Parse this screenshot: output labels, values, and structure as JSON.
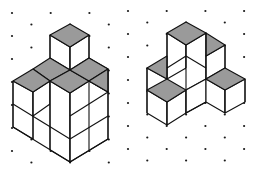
{
  "figure": {
    "colors": {
      "background": "#ffffff",
      "top_face": "#9a9a9a",
      "side_face": "#ffffff",
      "edge": "#111111",
      "dot": "#1a1a1a"
    },
    "grid": {
      "col_spacing": 19.35,
      "row_spacing": 23,
      "left_origin": [
        12,
        13
      ],
      "right_origin": [
        128,
        11
      ]
    },
    "left_solid": {
      "label": "left-cube-structure",
      "top_faces": [
        [
          [
            70,
            24
          ],
          [
            89,
            35
          ],
          [
            70,
            47
          ],
          [
            50,
            35
          ]
        ],
        [
          [
            33,
            69
          ],
          [
            50,
            58
          ],
          [
            70,
            70
          ],
          [
            50,
            81
          ]
        ],
        [
          [
            13,
            81
          ],
          [
            33,
            69
          ],
          [
            50,
            81
          ],
          [
            33,
            92
          ]
        ],
        [
          [
            50,
            81
          ],
          [
            70,
            70
          ],
          [
            89,
            81
          ],
          [
            70,
            93
          ]
        ],
        [
          [
            70,
            70
          ],
          [
            89,
            58
          ],
          [
            108,
            69
          ],
          [
            89,
            81
          ]
        ],
        [
          [
            89,
            81
          ],
          [
            108,
            69
          ],
          [
            108,
            92
          ],
          [
            89,
            81
          ]
        ]
      ],
      "lines": [
        [
          [
            50,
            35
          ],
          [
            50,
            58
          ]
        ],
        [
          [
            70,
            47
          ],
          [
            70,
            70
          ]
        ],
        [
          [
            89,
            35
          ],
          [
            89,
            58
          ]
        ],
        [
          [
            89,
            58
          ],
          [
            108,
            69
          ]
        ],
        [
          [
            108,
            69
          ],
          [
            108,
            116
          ]
        ],
        [
          [
            13,
            81
          ],
          [
            13,
            127
          ]
        ],
        [
          [
            33,
            92
          ],
          [
            33,
            139
          ]
        ],
        [
          [
            50,
            81
          ],
          [
            50,
            104
          ]
        ],
        [
          [
            70,
            93
          ],
          [
            70,
            162
          ]
        ],
        [
          [
            89,
            81
          ],
          [
            89,
            104
          ]
        ],
        [
          [
            108,
            92
          ],
          [
            108,
            139
          ]
        ],
        [
          [
            13,
            104
          ],
          [
            70,
            139
          ]
        ],
        [
          [
            13,
            127
          ],
          [
            70,
            162
          ]
        ],
        [
          [
            70,
            162
          ],
          [
            108,
            139
          ]
        ],
        [
          [
            70,
            139
          ],
          [
            108,
            116
          ]
        ],
        [
          [
            33,
            92
          ],
          [
            50,
            81
          ]
        ],
        [
          [
            70,
            93
          ],
          [
            89,
            81
          ]
        ],
        [
          [
            89,
            81
          ],
          [
            108,
            92
          ]
        ]
      ]
    },
    "right_solid": {
      "label": "right-cube-structure",
      "top_faces": [
        [
          [
            186,
            22
          ],
          [
            206,
            33
          ],
          [
            186,
            45
          ],
          [
            167,
            33
          ]
        ],
        [
          [
            206,
            33
          ],
          [
            225,
            45
          ],
          [
            206,
            56
          ],
          [
            206,
            33
          ]
        ],
        [
          [
            147,
            56
          ],
          [
            167,
            45
          ],
          [
            167,
            79
          ],
          [
            147,
            68
          ]
        ],
        [
          [
            147,
            90
          ],
          [
            167,
            79
          ],
          [
            186,
            90
          ],
          [
            167,
            102
          ]
        ],
        [
          [
            206,
            79
          ],
          [
            225,
            68
          ],
          [
            245,
            79
          ],
          [
            225,
            90
          ]
        ]
      ],
      "lines": [
        [
          [
            167,
            33
          ],
          [
            167,
            79
          ]
        ],
        [
          [
            186,
            45
          ],
          [
            186,
            68
          ]
        ],
        [
          [
            206,
            33
          ],
          [
            206,
            79
          ]
        ],
        [
          [
            225,
            45
          ],
          [
            225,
            68
          ]
        ],
        [
          [
            147,
            68
          ],
          [
            147,
            113
          ]
        ],
        [
          [
            167,
            102
          ],
          [
            167,
            125
          ]
        ],
        [
          [
            186,
            90
          ],
          [
            186,
            113
          ]
        ],
        [
          [
            225,
            90
          ],
          [
            225,
            113
          ]
        ],
        [
          [
            245,
            79
          ],
          [
            245,
            102
          ]
        ],
        [
          [
            147,
            113
          ],
          [
            167,
            125
          ]
        ],
        [
          [
            167,
            125
          ],
          [
            186,
            113
          ]
        ],
        [
          [
            186,
            113
          ],
          [
            206,
            102
          ]
        ],
        [
          [
            206,
            102
          ],
          [
            225,
            113
          ]
        ],
        [
          [
            225,
            113
          ],
          [
            245,
            102
          ]
        ],
        [
          [
            206,
            79
          ],
          [
            206,
            102
          ]
        ],
        [
          [
            167,
            68
          ],
          [
            186,
            56
          ]
        ],
        [
          [
            186,
            56
          ],
          [
            206,
            68
          ]
        ],
        [
          [
            186,
            90
          ],
          [
            206,
            79
          ]
        ]
      ]
    }
  }
}
